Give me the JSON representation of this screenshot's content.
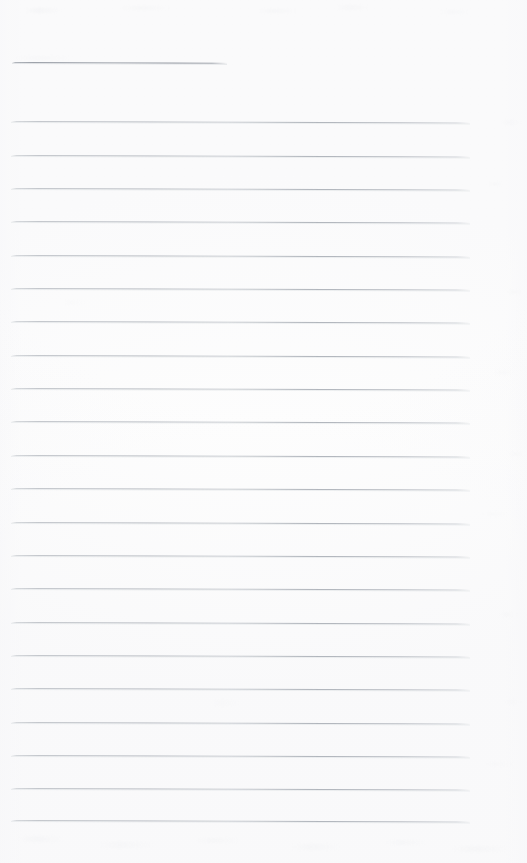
{
  "document": {
    "kind": "scanned-ruled-paper",
    "title": "",
    "visible_text": "",
    "page_width": 527,
    "page_height": 863,
    "background_color": "#fdfdfd",
    "rule_color": "#b6bac1",
    "short_rule_color": "#959aa3",
    "is_blank": true
  },
  "ruling": {
    "line_left_x": 11,
    "line_right_x": 470,
    "line_spacing": 33.3,
    "line_thickness": 1,
    "tilt_degrees": 0.18,
    "first_full_line_y": 121,
    "last_full_line_y": 820,
    "full_line_count": 22,
    "short_line_count": 1
  },
  "lines": [
    {
      "id": "rule-header",
      "y": 62,
      "x": 12,
      "width": 215,
      "type": "short"
    },
    {
      "id": "rule-1",
      "y": 121.0,
      "x": 11,
      "width": 459,
      "type": "full"
    },
    {
      "id": "rule-2",
      "y": 154.5,
      "x": 11,
      "width": 459,
      "type": "full"
    },
    {
      "id": "rule-3",
      "y": 187.9,
      "x": 11,
      "width": 459,
      "type": "full"
    },
    {
      "id": "rule-4",
      "y": 221.2,
      "x": 11,
      "width": 459,
      "type": "full"
    },
    {
      "id": "rule-5",
      "y": 254.6,
      "x": 11,
      "width": 459,
      "type": "full"
    },
    {
      "id": "rule-6",
      "y": 288.0,
      "x": 11,
      "width": 459,
      "type": "full"
    },
    {
      "id": "rule-7",
      "y": 321.3,
      "x": 11,
      "width": 459,
      "type": "full"
    },
    {
      "id": "rule-8",
      "y": 354.7,
      "x": 11,
      "width": 459,
      "type": "full"
    },
    {
      "id": "rule-9",
      "y": 388.0,
      "x": 11,
      "width": 459,
      "type": "full"
    },
    {
      "id": "rule-10",
      "y": 421.4,
      "x": 11,
      "width": 459,
      "type": "full"
    },
    {
      "id": "rule-11",
      "y": 454.8,
      "x": 11,
      "width": 459,
      "type": "full"
    },
    {
      "id": "rule-12",
      "y": 488.1,
      "x": 11,
      "width": 459,
      "type": "full"
    },
    {
      "id": "rule-13",
      "y": 521.5,
      "x": 11,
      "width": 459,
      "type": "full"
    },
    {
      "id": "rule-14",
      "y": 554.8,
      "x": 11,
      "width": 459,
      "type": "full"
    },
    {
      "id": "rule-15",
      "y": 588.2,
      "x": 11,
      "width": 459,
      "type": "full"
    },
    {
      "id": "rule-16",
      "y": 621.6,
      "x": 11,
      "width": 459,
      "type": "full"
    },
    {
      "id": "rule-17",
      "y": 654.9,
      "x": 11,
      "width": 459,
      "type": "full"
    },
    {
      "id": "rule-18",
      "y": 688.3,
      "x": 11,
      "width": 459,
      "type": "full"
    },
    {
      "id": "rule-19",
      "y": 721.6,
      "x": 11,
      "width": 459,
      "type": "full"
    },
    {
      "id": "rule-20",
      "y": 755.0,
      "x": 11,
      "width": 459,
      "type": "full"
    },
    {
      "id": "rule-21",
      "y": 788.4,
      "x": 11,
      "width": 459,
      "type": "full"
    },
    {
      "id": "rule-22",
      "y": 820.0,
      "x": 11,
      "width": 459,
      "type": "full"
    }
  ],
  "speckles": [
    {
      "x": 24,
      "y": 8,
      "w": 38,
      "h": 5,
      "o": 0.3
    },
    {
      "x": 120,
      "y": 6,
      "w": 52,
      "h": 4,
      "o": 0.22
    },
    {
      "x": 258,
      "y": 9,
      "w": 40,
      "h": 4,
      "o": 0.24
    },
    {
      "x": 336,
      "y": 5,
      "w": 34,
      "h": 5,
      "o": 0.2
    },
    {
      "x": 440,
      "y": 10,
      "w": 30,
      "h": 4,
      "o": 0.18
    },
    {
      "x": 14,
      "y": 56,
      "w": 60,
      "h": 4,
      "o": 0.16
    },
    {
      "x": 500,
      "y": 120,
      "w": 22,
      "h": 5,
      "o": 0.16
    },
    {
      "x": 487,
      "y": 182,
      "w": 18,
      "h": 4,
      "o": 0.14
    },
    {
      "x": 506,
      "y": 290,
      "w": 17,
      "h": 4,
      "o": 0.15
    },
    {
      "x": 492,
      "y": 370,
      "w": 24,
      "h": 5,
      "o": 0.13
    },
    {
      "x": 508,
      "y": 452,
      "w": 16,
      "h": 4,
      "o": 0.14
    },
    {
      "x": 482,
      "y": 512,
      "w": 26,
      "h": 4,
      "o": 0.12
    },
    {
      "x": 498,
      "y": 612,
      "w": 20,
      "h": 5,
      "o": 0.14
    },
    {
      "x": 504,
      "y": 700,
      "w": 18,
      "h": 4,
      "o": 0.13
    },
    {
      "x": 486,
      "y": 762,
      "w": 28,
      "h": 4,
      "o": 0.12
    },
    {
      "x": 18,
      "y": 836,
      "w": 46,
      "h": 6,
      "o": 0.22
    },
    {
      "x": 96,
      "y": 842,
      "w": 58,
      "h": 6,
      "o": 0.2
    },
    {
      "x": 196,
      "y": 838,
      "w": 44,
      "h": 5,
      "o": 0.18
    },
    {
      "x": 290,
      "y": 844,
      "w": 52,
      "h": 6,
      "o": 0.2
    },
    {
      "x": 386,
      "y": 840,
      "w": 40,
      "h": 5,
      "o": 0.18
    },
    {
      "x": 452,
      "y": 846,
      "w": 56,
      "h": 6,
      "o": 0.22
    },
    {
      "x": 210,
      "y": 700,
      "w": 30,
      "h": 6,
      "o": 0.1
    },
    {
      "x": 60,
      "y": 300,
      "w": 26,
      "h": 5,
      "o": 0.09
    }
  ]
}
